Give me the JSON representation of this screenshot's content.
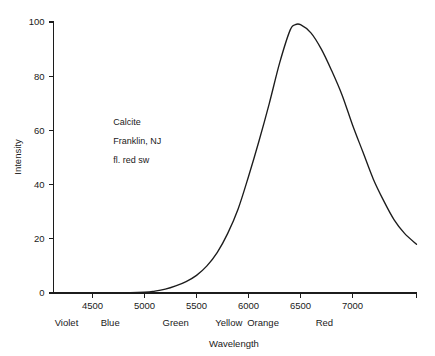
{
  "chart_data": {
    "type": "line",
    "title": "",
    "xlabel": "Wavelength",
    "ylabel": "Intensity",
    "xlim": [
      4125,
      7615
    ],
    "ylim": [
      0,
      100
    ],
    "grid": false,
    "legend": "none",
    "x_ticks": [
      4500,
      5000,
      5500,
      6000,
      6500,
      7000
    ],
    "x_tick_labels": [
      "4500",
      "5000",
      "5500",
      "6000",
      "6500",
      "7000"
    ],
    "y_ticks": [
      0,
      20,
      40,
      60,
      80,
      100
    ],
    "y_tick_labels": [
      "0",
      "20",
      "40",
      "60",
      "80",
      "100"
    ],
    "annotations": [
      {
        "text": "Calcite",
        "x": 4700,
        "y": 62
      },
      {
        "text": "Franklin, NJ",
        "x": 4700,
        "y": 55
      },
      {
        "text": "fl. red sw",
        "x": 4700,
        "y": 48
      }
    ],
    "color_bands": [
      {
        "label": "Violet",
        "x": 4250
      },
      {
        "label": "Blue",
        "x": 4670
      },
      {
        "label": "Green",
        "x": 5300
      },
      {
        "label": "Yellow",
        "x": 5810
      },
      {
        "label": "Orange",
        "x": 6140
      },
      {
        "label": "Red",
        "x": 6730
      }
    ],
    "series": [
      {
        "name": "Calcite fluorescence emission",
        "color": "#1c1c1c",
        "x": [
          4125,
          4400,
          4700,
          5000,
          5100,
          5200,
          5300,
          5400,
          5500,
          5600,
          5700,
          5800,
          5900,
          6000,
          6100,
          6200,
          6300,
          6400,
          6450,
          6500,
          6600,
          6700,
          6800,
          6900,
          7000,
          7100,
          7200,
          7300,
          7400,
          7500,
          7615
        ],
        "values": [
          0,
          0,
          0,
          0.3,
          0.7,
          1.4,
          2.6,
          4.2,
          6.5,
          10,
          15,
          22,
          31,
          43,
          56,
          70,
          85,
          97,
          99,
          99,
          96,
          90,
          82,
          73,
          62,
          52,
          42,
          34,
          27,
          22,
          18
        ]
      }
    ]
  }
}
